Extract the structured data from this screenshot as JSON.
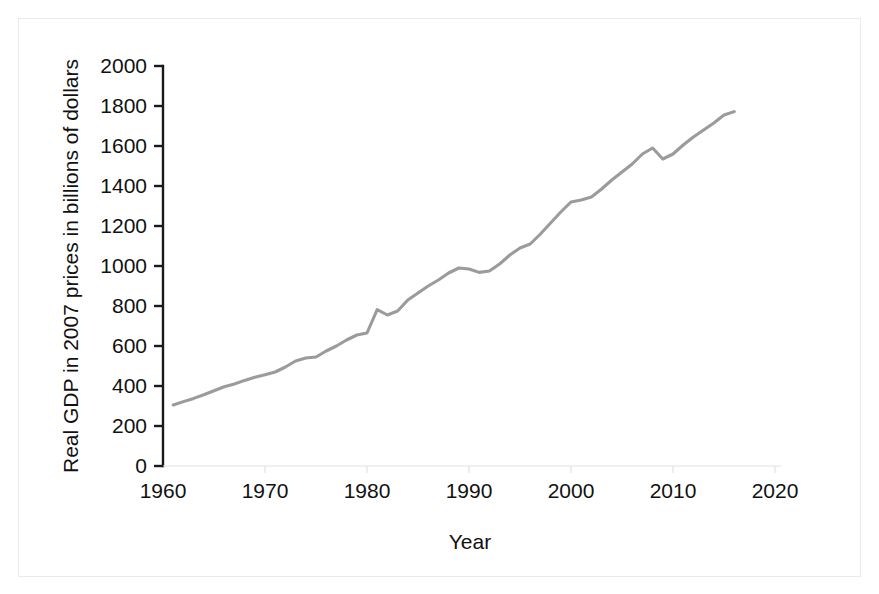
{
  "chart_data": {
    "type": "line",
    "title": "",
    "xlabel": "Year",
    "ylabel": "Real GDP in 2007 prices in billions of dollars",
    "xlim": [
      1960,
      2020
    ],
    "ylim": [
      0,
      2000
    ],
    "xticks": [
      1960,
      1970,
      1980,
      1990,
      2000,
      2010,
      2020
    ],
    "yticks": [
      0,
      200,
      400,
      600,
      800,
      1000,
      1200,
      1400,
      1600,
      1800,
      2000
    ],
    "xtick_labels": [
      "1960",
      "1970",
      "1980",
      "1990",
      "2000",
      "2010",
      "2020"
    ],
    "ytick_labels": [
      "0",
      "200",
      "400",
      "600",
      "800",
      "1000",
      "1200",
      "1400",
      "1600",
      "1800",
      "2000"
    ],
    "grid": false,
    "legend": false,
    "legend_position": "none",
    "line_color": "#9b9b9b",
    "axis_color": "#1a1a1a",
    "series": [
      {
        "name": "Real GDP",
        "x": [
          1961,
          1962,
          1963,
          1964,
          1965,
          1966,
          1967,
          1968,
          1969,
          1970,
          1971,
          1972,
          1973,
          1974,
          1975,
          1976,
          1977,
          1978,
          1979,
          1980,
          1981,
          1982,
          1983,
          1984,
          1985,
          1986,
          1987,
          1988,
          1989,
          1990,
          1991,
          1992,
          1993,
          1994,
          1995,
          1996,
          1997,
          1998,
          1999,
          2000,
          2001,
          2002,
          2003,
          2004,
          2005,
          2006,
          2007,
          2008,
          2009,
          2010,
          2011,
          2012,
          2013,
          2014,
          2015,
          2016
        ],
        "values": [
          305,
          322,
          338,
          356,
          376,
          396,
          410,
          428,
          444,
          456,
          470,
          495,
          525,
          540,
          545,
          575,
          600,
          630,
          655,
          665,
          782,
          755,
          775,
          830,
          865,
          900,
          930,
          965,
          990,
          985,
          968,
          975,
          1010,
          1055,
          1090,
          1110,
          1160,
          1215,
          1270,
          1320,
          1330,
          1345,
          1385,
          1430,
          1470,
          1510,
          1560,
          1590,
          1535,
          1560,
          1605,
          1645,
          1680,
          1715,
          1755,
          1772
        ]
      }
    ],
    "annotations": []
  },
  "figure": {
    "background_color": "#ffffff",
    "frame_color": "#ebebeb"
  }
}
